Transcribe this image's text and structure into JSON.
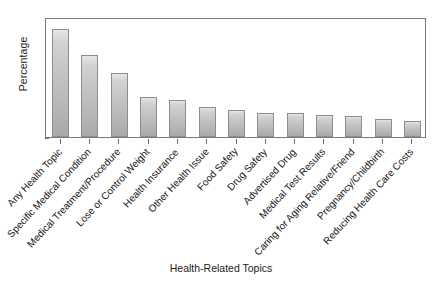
{
  "chart_data": {
    "type": "bar",
    "title": "",
    "xlabel": "Health-Related Topics",
    "ylabel": "Percentage",
    "ylim": [
      0,
      80
    ],
    "yticks": [
      0,
      10,
      20,
      30,
      40,
      50,
      60,
      70,
      80
    ],
    "grid": false,
    "legend": null,
    "categories": [
      "Any Health Topic",
      "Specific Medical Condition",
      "Medical Treatment/Procedure",
      "Lose or Control Weight",
      "Health Insurance",
      "Other Health Issue",
      "Food Safety",
      "Drug Safety",
      "Advertised Drug",
      "Medical Test Results",
      "Caring for Aging Relative/Friend",
      "Pregnancy/Childbirth",
      "Reducing Health Care Costs"
    ],
    "values": [
      72,
      55,
      43,
      27,
      25,
      20,
      18,
      16,
      16,
      15,
      14,
      12,
      11
    ],
    "bar_color": "#c2c2c2",
    "bar_edge_color": "#8d8d8d",
    "axis_color": "#7a7a7a",
    "background_color": "#ffffff"
  }
}
